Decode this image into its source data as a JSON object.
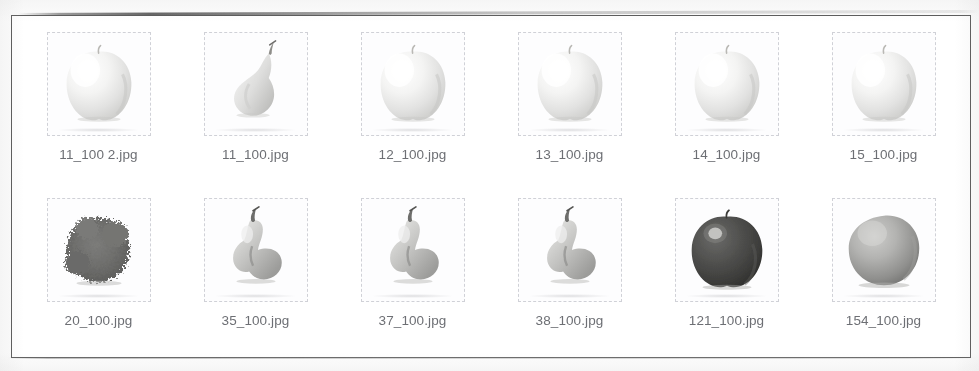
{
  "pane": {
    "name": "thumbnail-grid-pane",
    "border_color": "#5a5a5a",
    "background": "#ffffff"
  },
  "grid": {
    "columns": 6,
    "rows": 2,
    "items": [
      {
        "label": "11_100 2.jpg",
        "art": "apple-pale",
        "row": 1,
        "col": 1
      },
      {
        "label": "11_100.jpg",
        "art": "fig-pale",
        "row": 1,
        "col": 2
      },
      {
        "label": "12_100.jpg",
        "art": "apple-pale",
        "row": 1,
        "col": 3
      },
      {
        "label": "13_100.jpg",
        "art": "apple-pale",
        "row": 1,
        "col": 4
      },
      {
        "label": "14_100.jpg",
        "art": "apple-pale",
        "row": 1,
        "col": 5
      },
      {
        "label": "15_100.jpg",
        "art": "apple-pale",
        "row": 1,
        "col": 6
      },
      {
        "label": "20_100.jpg",
        "art": "fuzzy-dark",
        "row": 2,
        "col": 1
      },
      {
        "label": "35_100.jpg",
        "art": "pear-grey",
        "row": 2,
        "col": 2
      },
      {
        "label": "37_100.jpg",
        "art": "pear-grey",
        "row": 2,
        "col": 3
      },
      {
        "label": "38_100.jpg",
        "art": "pear-grey",
        "row": 2,
        "col": 4
      },
      {
        "label": "121_100.jpg",
        "art": "apple-dark",
        "row": 2,
        "col": 5
      },
      {
        "label": "154_100.jpg",
        "art": "sphere-grey",
        "row": 2,
        "col": 6
      }
    ]
  },
  "colors": {
    "label_text": "#6d6f74",
    "pane_border": "#5a5a5a",
    "thumb_outline": "#9b9ea8",
    "page_background": "#fdfdfd"
  }
}
